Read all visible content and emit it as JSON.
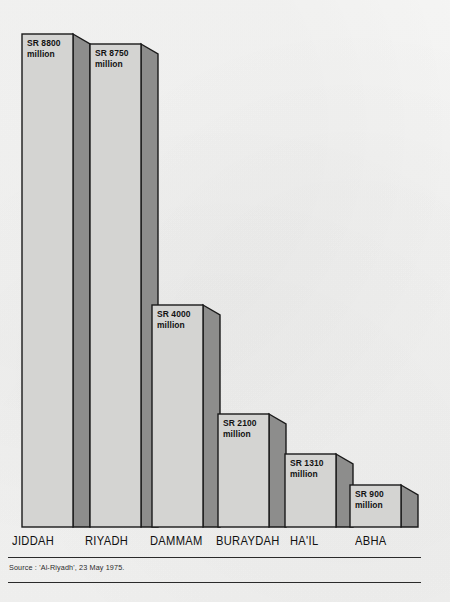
{
  "chart_data": {
    "type": "bar",
    "title": "",
    "subtitle": "",
    "xlabel": "",
    "ylabel": "",
    "ylim": [
      0,
      8800
    ],
    "grid": false,
    "legend": "none",
    "style": "3d-block-bars",
    "currency_unit": "SR million",
    "categories": [
      "JIDDAH",
      "RIYADH",
      "DAMMAM",
      "BURAYDAH",
      "HA'IL",
      "ABHA"
    ],
    "values": [
      8800,
      8750,
      4000,
      2100,
      1310,
      900
    ],
    "data_labels": [
      "SR 8800\nmillion",
      "SR 8750\nmillion",
      "SR 4000\nmillion",
      "SR 2100\nmillion",
      "SR 1310\nmillion",
      "SR 900\nmillion"
    ],
    "source_note": "Source : 'Al-Riyadh', 23 May 1975.",
    "colors": {
      "bar_face": "#d4d4d2",
      "bar_side": "#8d8d8c",
      "outline": "#1a1a1a",
      "background": "#f3f3f2",
      "text": "#121212"
    }
  },
  "bars": [
    {
      "name": "jiddah",
      "label": "SR 8800\nmillion",
      "cat": "JIDDAH",
      "x": 22,
      "w": 51,
      "sw": 17,
      "top": 34,
      "label_x": 27,
      "label_y": 38,
      "cat_x": 12
    },
    {
      "name": "riyadh",
      "label": "SR 8750\nmillion",
      "cat": "RIYADH",
      "x": 90,
      "w": 51,
      "sw": 17,
      "top": 44,
      "label_x": 95,
      "label_y": 48,
      "cat_x": 85
    },
    {
      "name": "dammam",
      "label": "SR 4000\nmillion",
      "cat": "DAMMAM",
      "x": 152,
      "w": 51,
      "sw": 17,
      "top": 305,
      "label_x": 157,
      "label_y": 309,
      "cat_x": 150
    },
    {
      "name": "buraydah",
      "label": "SR 2100\nmillion",
      "cat": "BURAYDAH",
      "x": 218,
      "w": 51,
      "sw": 17,
      "top": 414,
      "label_x": 223,
      "label_y": 418,
      "cat_x": 216
    },
    {
      "name": "hail",
      "label": "SR 1310\nmillion",
      "cat": "HA'IL",
      "x": 285,
      "w": 51,
      "sw": 17,
      "top": 454,
      "label_x": 290,
      "label_y": 458,
      "cat_x": 290
    },
    {
      "name": "abha",
      "label": "SR 900\nmillion",
      "cat": "ABHA",
      "x": 350,
      "w": 51,
      "sw": 17,
      "top": 485,
      "label_x": 355,
      "label_y": 489,
      "cat_x": 355
    }
  ],
  "baseline_y": 527,
  "source_note": "Source : 'Al-Riyadh', 23 May 1975."
}
